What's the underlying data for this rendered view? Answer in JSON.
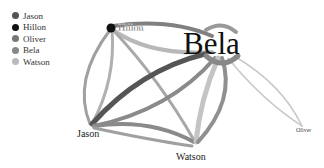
{
  "legend": {
    "items": [
      {
        "label": "Jason",
        "color": "#555555"
      },
      {
        "label": "Hillon",
        "color": "#111111"
      },
      {
        "label": "Oliver",
        "color": "#777777"
      },
      {
        "label": "Bela",
        "color": "#888888"
      },
      {
        "label": "Watson",
        "color": "#bbbbbb"
      }
    ]
  },
  "nodes": [
    {
      "id": "Hillon",
      "label": "Hillon",
      "x": 111,
      "y": 28,
      "font_size": 10,
      "color": "#111111"
    },
    {
      "id": "Bela",
      "label": "Bela",
      "x": 230,
      "y": 44,
      "font_size": 30,
      "color": "#888888"
    },
    {
      "id": "Jason",
      "label": "Jason",
      "x": 90,
      "y": 133,
      "font_size": 10,
      "color": "#555555"
    },
    {
      "id": "Watson",
      "label": "Watson",
      "x": 195,
      "y": 158,
      "font_size": 10,
      "color": "#bbbbbb"
    },
    {
      "id": "Oliver",
      "label": "Oliver",
      "x": 303,
      "y": 131,
      "font_size": 6,
      "color": "#777777"
    }
  ]
}
